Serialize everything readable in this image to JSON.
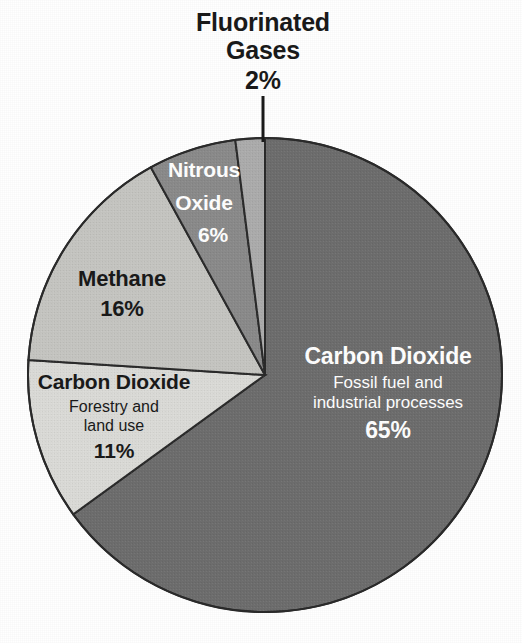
{
  "chart_data": {
    "type": "pie",
    "title": "Fluorinated Gases",
    "subtitle": "",
    "categories": [
      "Carbon Dioxide",
      "Carbon Dioxide",
      "Methane",
      "Nitrous Oxide",
      "Fluorinated Gases"
    ],
    "values": [
      65,
      11,
      16,
      6,
      2
    ],
    "legend_position": "none",
    "grid": false,
    "slices": [
      {
        "name": "Carbon Dioxide",
        "sublabel": "Fossil fuel and industrial processes",
        "sublabel_line1": "Fossil fuel and",
        "sublabel_line2": "industrial processes",
        "value": 65,
        "percent_label": "65%",
        "color": "#6e6e6e",
        "text_color": "#ffffff"
      },
      {
        "name": "Carbon Dioxide",
        "sublabel": "Forestry and land use",
        "sublabel_line1": "Forestry and",
        "sublabel_line2": "land use",
        "value": 11,
        "percent_label": "11%",
        "color": "#dcdcd8",
        "text_color": "#1a1a1a"
      },
      {
        "name": "Methane",
        "sublabel": "",
        "value": 16,
        "percent_label": "16%",
        "color": "#c6c6c2",
        "text_color": "#1a1a1a"
      },
      {
        "name": "Nitrous Oxide",
        "name_line1": "Nitrous",
        "name_line2": "Oxide",
        "sublabel": "",
        "value": 6,
        "percent_label": "6%",
        "color": "#8b8b8b",
        "text_color": "#ffffff"
      },
      {
        "name": "Fluorinated Gases",
        "name_line1": "Fluorinated",
        "name_line2": "Gases",
        "sublabel": "",
        "value": 2,
        "percent_label": "2%",
        "color": "#adadad",
        "text_color": "#1a1a1a"
      }
    ]
  },
  "callout": {
    "title_line1": "Fluorinated",
    "title_line2": "Gases",
    "percent": "2%"
  },
  "colors": {
    "background": "#ffffff",
    "slice_outline": "#2b2b2b",
    "leader_line": "#1a1a1a"
  }
}
